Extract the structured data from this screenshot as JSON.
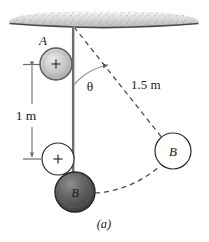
{
  "figure": {
    "caption": "(a)",
    "labels": {
      "sphere_a": "A",
      "sphere_b_dark": "B",
      "sphere_b_right": "B",
      "angle": "θ",
      "length_vertical": "1 m",
      "length_diagonal": "1.5 m",
      "charge_a": "+",
      "charge_b": "+"
    },
    "colors": {
      "ceiling_fill": "#d9d9d9",
      "ceiling_edge": "#4a4a4a",
      "sphere_a_fill": "#c6c6c6",
      "sphere_a_edge": "#5a5a5a",
      "sphere_b_dark_fill": "#5e5e5e",
      "sphere_b_dark_edge": "#2b2b2b",
      "circle_outline": "#2b2b2b",
      "string": "#6e6e6e",
      "dashed": "#4a4a4a",
      "dimension": "#6e6e6e",
      "text": "#1a1a1a",
      "background": "#ffffff"
    },
    "geometry": {
      "pivot": {
        "x": 73,
        "y": 26
      },
      "sphere_a": {
        "cx": 56,
        "cy": 64,
        "r": 16
      },
      "charge_circle_lower": {
        "cx": 58,
        "cy": 159,
        "r": 16
      },
      "sphere_b_dark": {
        "cx": 75,
        "cy": 192,
        "r": 20
      },
      "sphere_b_right": {
        "cx": 173,
        "cy": 151,
        "r": 18
      },
      "dimension_line": {
        "x": 32,
        "y_top": 64,
        "y_bottom": 159
      },
      "string": {
        "x": 73,
        "y_top": 26,
        "y_bottom": 180
      },
      "angle_arc_radius": 60
    },
    "label_positions": {
      "sphere_a": {
        "x": 43,
        "y": 43
      },
      "angle": {
        "x": 90,
        "y": 90
      },
      "length_vertical": {
        "x": 26,
        "y": 116
      },
      "length_diagonal": {
        "x": 131,
        "y": 88
      },
      "sphere_b_dark": {
        "x": 75,
        "y": 197
      },
      "sphere_b_right": {
        "x": 173,
        "y": 156
      },
      "caption": {
        "x": 104,
        "y": 227
      }
    }
  }
}
